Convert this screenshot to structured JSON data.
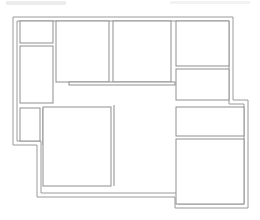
{
  "diagram": {
    "type": "floor-plan",
    "title": "",
    "rooms": [
      {
        "id": "room-top-left-small",
        "label": ""
      },
      {
        "id": "room-left-tall",
        "label": ""
      },
      {
        "id": "room-top-center-left",
        "label": ""
      },
      {
        "id": "room-top-center-right",
        "label": ""
      },
      {
        "id": "room-top-right",
        "label": ""
      },
      {
        "id": "room-right-middle",
        "label": ""
      },
      {
        "id": "room-left-nook",
        "label": ""
      },
      {
        "id": "room-bottom-center",
        "label": ""
      },
      {
        "id": "room-bottom-right-upper",
        "label": ""
      },
      {
        "id": "room-bottom-right-lower",
        "label": ""
      }
    ],
    "colors": {
      "wall": "#9a9a9a",
      "background": "#ffffff"
    }
  }
}
